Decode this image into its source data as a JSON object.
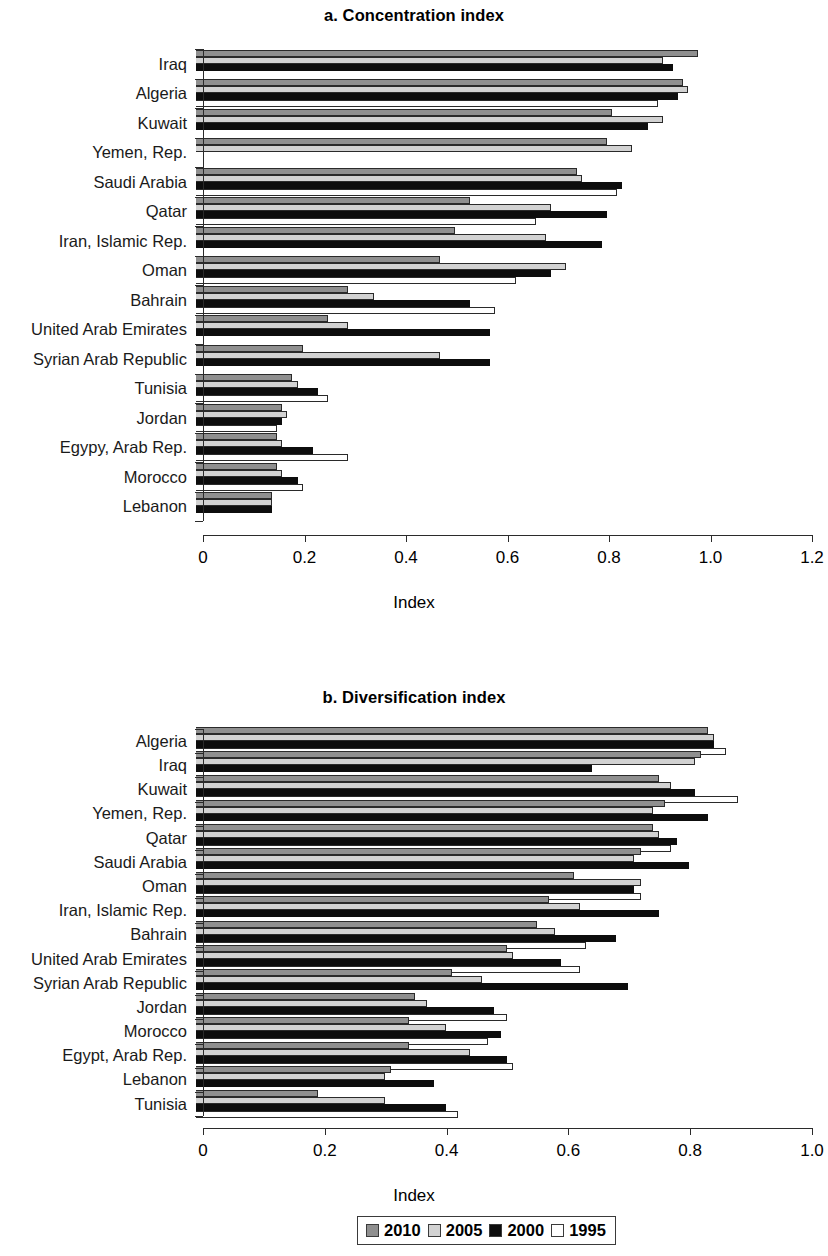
{
  "figure": {
    "axis_title": "Index",
    "legend": {
      "entries": [
        {
          "label": "2010",
          "color": "#8f8f8f",
          "key": "y2010"
        },
        {
          "label": "2005",
          "color": "#d2d2d2",
          "key": "y2005"
        },
        {
          "label": "2000",
          "color": "#0d0d0d",
          "key": "y2000"
        },
        {
          "label": "1995",
          "color": "#ffffff",
          "key": "y1995"
        }
      ]
    }
  },
  "chart_data": [
    {
      "id": "panel-a",
      "type": "bar",
      "orientation": "horizontal",
      "title": "a. Concentration index",
      "xlabel": "Index",
      "ylabel": "",
      "xlim": [
        0,
        1.2
      ],
      "xticks": [
        "0",
        "0.2",
        "0.4",
        "0.6",
        "0.8",
        "1.0",
        "1.2"
      ],
      "xtick_values": [
        0,
        0.2,
        0.4,
        0.6,
        0.8,
        1.0,
        1.2
      ],
      "grid": false,
      "legend_position": "bottom",
      "categories": [
        "Iraq",
        "Algeria",
        "Kuwait",
        "Yemen, Rep.",
        "Saudi Arabia",
        "Qatar",
        "Iran, Islamic Rep.",
        "Oman",
        "Bahrain",
        "United Arab Emirates",
        "Syrian Arab Republic",
        "Tunisia",
        "Jordan",
        "Egypy, Arab Rep.",
        "Morocco",
        "Lebanon"
      ],
      "series": [
        {
          "name": "2010",
          "values": [
            0.99,
            0.96,
            0.82,
            0.81,
            0.75,
            0.54,
            0.51,
            0.48,
            0.3,
            0.26,
            0.21,
            0.19,
            0.17,
            0.16,
            0.16,
            0.15
          ]
        },
        {
          "name": "2005",
          "values": [
            0.92,
            0.97,
            0.92,
            0.86,
            0.76,
            0.7,
            0.69,
            0.73,
            0.35,
            0.3,
            0.48,
            0.2,
            0.18,
            0.17,
            0.17,
            0.15
          ]
        },
        {
          "name": "2000",
          "values": [
            0.94,
            0.95,
            0.89,
            0.0,
            0.84,
            0.81,
            0.8,
            0.7,
            0.54,
            0.58,
            0.58,
            0.24,
            0.17,
            0.23,
            0.2,
            0.15
          ]
        },
        {
          "name": "1995",
          "values": [
            0.0,
            0.91,
            0.0,
            0.0,
            0.83,
            0.67,
            0.0,
            0.63,
            0.59,
            0.0,
            0.0,
            0.26,
            0.16,
            0.3,
            0.21,
            0.0
          ]
        }
      ]
    },
    {
      "id": "panel-b",
      "type": "bar",
      "orientation": "horizontal",
      "title": "b. Diversification index",
      "xlabel": "Index",
      "ylabel": "",
      "xlim": [
        0,
        1.0
      ],
      "xticks": [
        "0",
        "0.2",
        "0.4",
        "0.6",
        "0.8",
        "1.0"
      ],
      "xtick_values": [
        0,
        0.2,
        0.4,
        0.6,
        0.8,
        1.0
      ],
      "grid": false,
      "legend_position": "bottom",
      "categories": [
        "Algeria",
        "Iraq",
        "Kuwait",
        "Yemen, Rep.",
        "Qatar",
        "Saudi Arabia",
        "Oman",
        "Iran, Islamic Rep.",
        "Bahrain",
        "United Arab Emirates",
        "Syrian Arab Republic",
        "Jordan",
        "Morocco",
        "Egypt, Arab Rep.",
        "Lebanon",
        "Tunisia"
      ],
      "series": [
        {
          "name": "2010",
          "values": [
            0.84,
            0.83,
            0.76,
            0.77,
            0.75,
            0.73,
            0.62,
            0.58,
            0.56,
            0.51,
            0.42,
            0.36,
            0.35,
            0.35,
            0.32,
            0.2
          ]
        },
        {
          "name": "2005",
          "values": [
            0.85,
            0.82,
            0.78,
            0.75,
            0.76,
            0.72,
            0.73,
            0.63,
            0.59,
            0.52,
            0.47,
            0.38,
            0.41,
            0.45,
            0.31,
            0.31
          ]
        },
        {
          "name": "2000",
          "values": [
            0.85,
            0.65,
            0.82,
            0.84,
            0.79,
            0.81,
            0.72,
            0.76,
            0.69,
            0.6,
            0.71,
            0.49,
            0.5,
            0.51,
            0.39,
            0.41
          ]
        },
        {
          "name": "1995",
          "values": [
            0.87,
            0.0,
            0.89,
            0.0,
            0.78,
            0.0,
            0.73,
            0.0,
            0.64,
            0.63,
            0.0,
            0.51,
            0.48,
            0.52,
            0.0,
            0.43
          ]
        }
      ]
    }
  ]
}
